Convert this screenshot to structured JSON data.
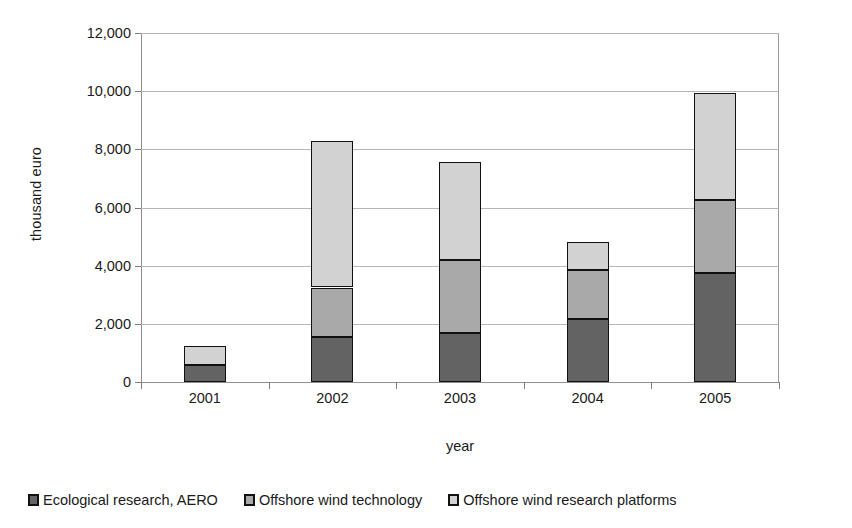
{
  "chart_data": {
    "type": "bar",
    "subtype": "stacked-column",
    "title": "",
    "xlabel": "year",
    "ylabel": "thousand euro",
    "categories": [
      "2001",
      "2002",
      "2003",
      "2004",
      "2005"
    ],
    "ylim": [
      0,
      12000
    ],
    "ytick_values": [
      0,
      2000,
      4000,
      6000,
      8000,
      10000,
      12000
    ],
    "ytick_labels": [
      "0",
      "2,000",
      "4,000",
      "6,000",
      "8,000",
      "10,000",
      "12,000"
    ],
    "grid": true,
    "legend_position": "bottom",
    "series": [
      {
        "name": "Ecological research, AERO",
        "color": "#636363",
        "values": [
          580,
          1540,
          1680,
          2150,
          3740
        ]
      },
      {
        "name": "Offshore wind technology",
        "color": "#a9a9a9",
        "values": [
          0,
          1710,
          2520,
          1700,
          2510
        ]
      },
      {
        "name": "Offshore wind research platforms",
        "color": "#d2d2d2",
        "values": [
          660,
          5050,
          3380,
          980,
          3680
        ]
      }
    ],
    "totals": [
      1240,
      8300,
      7580,
      4830,
      9930
    ]
  },
  "axes": {
    "y_title": "thousand euro",
    "x_title": "year"
  },
  "legend": {
    "items": [
      {
        "label": "Ecological research, AERO",
        "color": "#636363"
      },
      {
        "label": "Offshore wind technology",
        "color": "#a9a9a9"
      },
      {
        "label": "Offshore wind research platforms",
        "color": "#d2d2d2"
      }
    ]
  }
}
